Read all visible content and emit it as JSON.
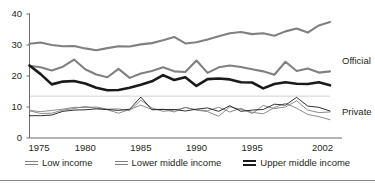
{
  "figure": {
    "title_sliver": "",
    "band_labels": {
      "official": "Official",
      "private": "Private"
    }
  },
  "colors": {
    "low_income": "#808080",
    "lower_middle_income": "#808080",
    "upper_middle_income": "#1a1a1a",
    "axis": "#6d6d72",
    "gridline": "#d2d2d4",
    "text": "#231f20",
    "rule": "#8a8a8e"
  },
  "legend": {
    "items": [
      {
        "label": "Low income",
        "color": "#808080",
        "weight": "thin"
      },
      {
        "label": "Lower middle income",
        "color": "#808080",
        "weight": "thin"
      },
      {
        "label": "Upper middle income",
        "color": "#1a1a1a",
        "weight": "thick"
      }
    ]
  },
  "chart_data": {
    "type": "line",
    "title": "",
    "xlabel": "",
    "ylabel": "",
    "xlim": [
      1975,
      2002
    ],
    "ylim": [
      0,
      40
    ],
    "yticks": [
      0,
      10,
      20,
      30,
      40
    ],
    "xticks": [
      1975,
      1980,
      1985,
      1990,
      1995,
      2002
    ],
    "grid": "single light horizontal line at 13.5",
    "legend_position": "bottom-center",
    "annotations": [
      {
        "text": "Official",
        "value": 25.0,
        "x": 2002
      },
      {
        "text": "Private",
        "value": 8.5,
        "x": 2002
      }
    ],
    "x": [
      1975,
      1976,
      1977,
      1978,
      1979,
      1980,
      1981,
      1982,
      1983,
      1984,
      1985,
      1986,
      1987,
      1988,
      1989,
      1990,
      1991,
      1992,
      1993,
      1994,
      1995,
      1996,
      1997,
      1998,
      1999,
      2000,
      2001,
      2002
    ],
    "series": [
      {
        "name": "Low income",
        "group": "Official",
        "color": "#808080",
        "weight": "thick",
        "values": [
          30.4,
          30.8,
          30.0,
          29.6,
          29.7,
          28.9,
          28.3,
          29.0,
          29.6,
          29.5,
          30.2,
          30.6,
          31.5,
          32.6,
          30.5,
          30.9,
          31.8,
          32.8,
          33.8,
          34.2,
          33.5,
          33.8,
          33.0,
          34.4,
          35.3,
          34.0,
          36.3,
          37.4
        ]
      },
      {
        "name": "Lower middle income",
        "group": "Official",
        "color": "#808080",
        "weight": "thick",
        "values": [
          23.3,
          22.8,
          21.8,
          23.0,
          25.3,
          22.2,
          20.5,
          19.6,
          22.3,
          19.4,
          20.8,
          21.6,
          22.8,
          21.5,
          21.3,
          25.0,
          21.0,
          22.8,
          23.4,
          22.9,
          22.2,
          21.5,
          20.4,
          24.6,
          21.6,
          22.4,
          21.1,
          21.5
        ]
      },
      {
        "name": "Upper middle income",
        "group": "Official",
        "color": "#1a1a1a",
        "weight": "thick",
        "values": [
          23.4,
          20.6,
          17.3,
          18.2,
          18.4,
          17.6,
          16.2,
          15.4,
          15.5,
          16.2,
          17.2,
          18.3,
          20.3,
          18.7,
          19.6,
          16.8,
          19.0,
          19.2,
          18.9,
          18.0,
          17.9,
          16.0,
          17.4,
          18.0,
          17.5,
          17.4,
          18.0,
          17.0
        ]
      },
      {
        "name": "Low income",
        "group": "Private",
        "color": "#808080",
        "weight": "thin",
        "values": [
          8.9,
          8.5,
          8.9,
          9.3,
          9.9,
          9.8,
          10.0,
          9.3,
          9.4,
          8.8,
          12.2,
          9.7,
          8.6,
          9.0,
          9.8,
          9.0,
          8.5,
          7.0,
          10.1,
          9.2,
          8.3,
          7.8,
          9.8,
          11.2,
          9.6,
          7.6,
          6.9,
          5.9
        ]
      },
      {
        "name": "Lower middle income",
        "group": "Private",
        "color": "#808080",
        "weight": "thin",
        "values": [
          8.8,
          7.9,
          8.0,
          9.0,
          9.5,
          10.2,
          9.6,
          9.1,
          8.0,
          9.2,
          10.6,
          9.2,
          9.3,
          8.4,
          9.9,
          9.1,
          8.8,
          9.9,
          8.4,
          9.6,
          7.9,
          10.5,
          9.5,
          10.0,
          12.0,
          9.0,
          8.2,
          8.4
        ]
      },
      {
        "name": "Upper middle income",
        "group": "Private",
        "color": "#1a1a1a",
        "weight": "thin",
        "values": [
          7.2,
          7.2,
          7.4,
          8.6,
          9.0,
          9.1,
          9.4,
          9.2,
          8.9,
          9.3,
          13.2,
          9.1,
          9.2,
          9.2,
          8.7,
          9.3,
          9.7,
          8.6,
          10.4,
          8.6,
          9.0,
          9.2,
          10.9,
          10.6,
          13.1,
          10.3,
          9.9,
          8.7
        ]
      }
    ]
  }
}
